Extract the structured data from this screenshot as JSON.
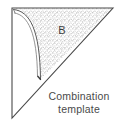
{
  "figure": {
    "name": "combination-template-diagram",
    "caption": {
      "line1": "Combination",
      "line2": "template"
    },
    "region_label": "B",
    "colors": {
      "outline": "#4a4a4a",
      "arc": "#5a5a5a",
      "stipple": "#8c8c8c",
      "text": "#4a4a4a",
      "background": "#ffffff"
    },
    "geometry": {
      "shape": "right-triangle",
      "vertices": {
        "top_left": [
          12,
          8
        ],
        "top_right": [
          113,
          8
        ],
        "bottom_left": [
          12,
          118
        ]
      },
      "arc": {
        "description": "double-line arc from top-left corner to hypotenuse",
        "start": [
          14,
          10
        ],
        "end": [
          41,
          79
        ],
        "inner_offset": 3
      },
      "stipple_region": "area between arc and top/hypotenuse edges"
    }
  }
}
